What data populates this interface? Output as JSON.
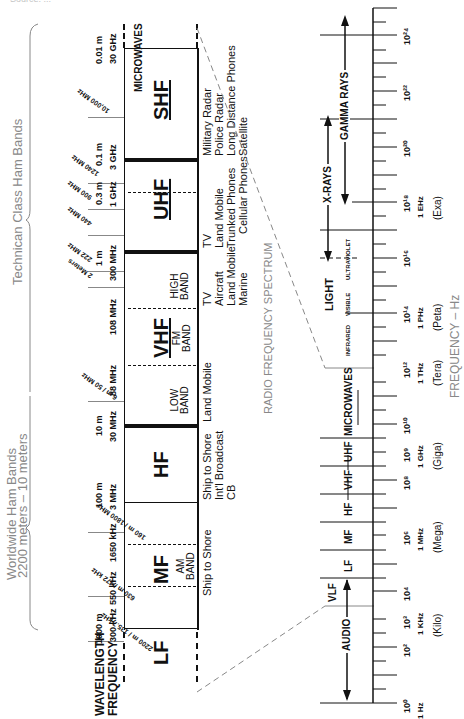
{
  "header": {
    "cut_text": "Source: ..."
  },
  "left_braces": {
    "technician": "Technican Class Ham Bands",
    "worldwide_line1": "Worldwide Ham Bands",
    "worldwide_line2": "2200 meters – 10 meters"
  },
  "axis_labels": {
    "wavelength": "WAVELENGTH",
    "frequency": "FREQUENCY"
  },
  "ham_bands": [
    {
      "label": "10,000 MHz",
      "y": 117
    },
    {
      "label": "1240 MHz",
      "y": 183
    },
    {
      "label": "900 MHz",
      "y": 209
    },
    {
      "label": "440 MHz",
      "y": 235
    },
    {
      "label": "222 MHz",
      "y": 271
    },
    {
      "label": "2 Meters",
      "y": 287
    },
    {
      "label": "6 m / 50 MHz",
      "y": 401
    },
    {
      "label": "160 m / 1800 MHz",
      "y": 532
    },
    {
      "label": "630 m / 472 kHz",
      "y": 596
    },
    {
      "label": "2200 m / 135.7 kHz",
      "y": 641
    }
  ],
  "boundaries": [
    {
      "wavelength": "0.01 m",
      "frequency": "30 GHz"
    },
    {
      "wavelength": "0.1 m",
      "frequency": "3 GHz"
    },
    {
      "wavelength": "0.3 m",
      "frequency": "1 GHz"
    },
    {
      "wavelength": "1 m",
      "frequency": "300 MHz"
    },
    {
      "wavelength": "",
      "frequency": "108 MHz"
    },
    {
      "wavelength": "",
      "frequency": "88 MHz"
    },
    {
      "wavelength": "10 m",
      "frequency": "30 MHz"
    },
    {
      "wavelength": "100 m",
      "frequency": "3 MHz"
    },
    {
      "wavelength": "",
      "frequency": "1650 kHz"
    },
    {
      "wavelength": "",
      "frequency": "550 kHz"
    },
    {
      "wavelength": "1000 m",
      "frequency": "300 kHz"
    }
  ],
  "bands": {
    "microwaves": "MICROWAVES",
    "shf": "SHF",
    "uhf": "UHF",
    "vhf": "VHF",
    "vhf_high": [
      "HIGH",
      "BAND"
    ],
    "vhf_fm": [
      "FM",
      "BAND"
    ],
    "vhf_low": [
      "LOW",
      "BAND"
    ],
    "hf": "HF",
    "mf": "MF",
    "mf_am": [
      "AM",
      "BAND"
    ],
    "lf": "LF"
  },
  "uses": {
    "shf": [
      "Military Radar",
      "Police Radar",
      "Long Distance Phones",
      "Satellite"
    ],
    "uhf": [
      "TV",
      "Land Mobile",
      "Trunked Phones",
      "Cellular Phones"
    ],
    "vhf_high": [
      "TV",
      "Aircraft",
      "Land Mobile",
      "Marine"
    ],
    "vhf_low": [
      "Land Mobile"
    ],
    "hf": [
      "Ship to Shore",
      "Int'l Broadcast",
      "CB"
    ],
    "mf": [
      "Ship to Shore"
    ]
  },
  "titles": {
    "radio_spectrum": "RADIO FREQUENCY SPECTRUM",
    "frequency_axis": "FREQUENCY – Hz"
  },
  "spectrum": {
    "gamma": "GAMMA RAYS",
    "xrays": "X-RAYS",
    "light": "LIGHT",
    "ultraviolet": "ULTRAVIOLET",
    "visible": "VISIBLE",
    "infrared": "INFRARED",
    "microwaves": "MICROWAVES",
    "uhf": "UHF",
    "vhf": "VHF",
    "hf": "HF",
    "mf": "MF",
    "lf": "LF",
    "vlf": "VLF",
    "audio": "AUDIO"
  },
  "scale": [
    {
      "exp": "10²⁴",
      "y": 35
    },
    {
      "exp": "10²²",
      "y": 91
    },
    {
      "exp": "10²⁰",
      "y": 147
    },
    {
      "exp": "10¹⁸",
      "y": 202,
      "unit": "1 EHz",
      "prefix": "(Exa)"
    },
    {
      "exp": "10¹⁶",
      "y": 257
    },
    {
      "exp": "10¹⁴",
      "y": 313,
      "unit": "1 PHz",
      "prefix": "(Peta)"
    },
    {
      "exp": "10¹²",
      "y": 368,
      "unit": "1 THz",
      "prefix": "(Tera)"
    },
    {
      "exp": "10¹⁰",
      "y": 424
    },
    {
      "exp": "10⁹",
      "y": 452,
      "unit": "1 GHz",
      "prefix": "(Giga)"
    },
    {
      "exp": "10⁸",
      "y": 480
    },
    {
      "exp": "10⁶",
      "y": 535,
      "unit": "1 MHz",
      "prefix": "(Mega)"
    },
    {
      "exp": "10⁴",
      "y": 591
    },
    {
      "exp": "10³",
      "y": 619,
      "unit": "1 KHz",
      "prefix": "(Kilo)"
    },
    {
      "exp": "10²",
      "y": 647
    },
    {
      "exp": "10⁰",
      "y": 703,
      "unit": "1 Hz"
    }
  ],
  "colors": {
    "ink": "#111111",
    "gray": "#888888"
  }
}
